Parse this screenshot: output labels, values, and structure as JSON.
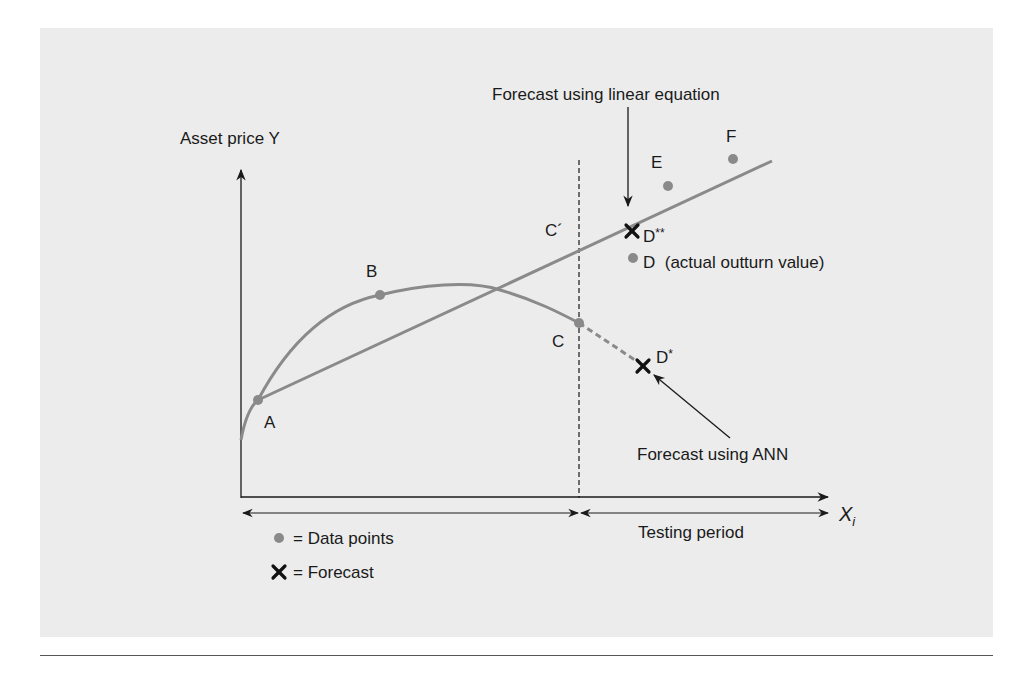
{
  "figure": {
    "y_axis_label": "Asset price Y",
    "x_axis_label": "X",
    "x_axis_label_subscript": "i",
    "annotation_linear": "Forecast using linear equation",
    "annotation_ann": "Forecast using ANN",
    "period_testing": "Testing period",
    "points": {
      "A": "A",
      "B": "B",
      "C": "C",
      "C_prime": "C´",
      "D": "D",
      "D_note": "(actual outturn value)",
      "D_star": "D",
      "D_star_sup": "*",
      "D_dstar": "D",
      "D_dstar_sup": "**",
      "E": "E",
      "F": "F"
    },
    "legend": {
      "data_points": "= Data points",
      "forecast": "= Forecast",
      "forecast_symbol": "✕"
    },
    "colors": {
      "panel_bg": "#ececec",
      "curve": "#8a8a8a",
      "axis": "#1a1a1a",
      "text": "#1a1a1a"
    }
  }
}
